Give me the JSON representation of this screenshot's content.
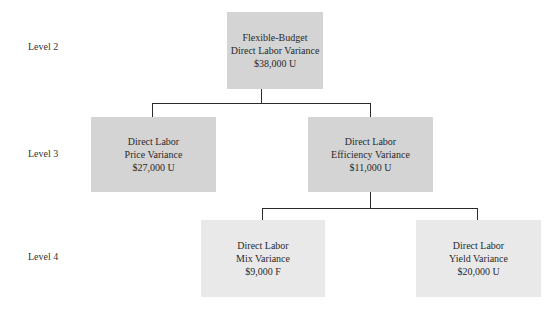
{
  "levels": [
    "Level 2",
    "Level 3",
    "Level 4"
  ],
  "nodes": {
    "root": {
      "line1": "Flexible-Budget",
      "line2": "Direct Labor Variance",
      "value": "$38,000 U"
    },
    "price": {
      "line1": "Direct Labor",
      "line2": "Price Variance",
      "value": "$27,000 U"
    },
    "efficiency": {
      "line1": "Direct Labor",
      "line2": "Efficiency Variance",
      "value": "$11,000 U"
    },
    "mix": {
      "line1": "Direct Labor",
      "line2": "Mix Variance",
      "value": "$9,000 F"
    },
    "yield": {
      "line1": "Direct Labor",
      "line2": "Yield Variance",
      "value": "$20,000 U"
    }
  },
  "colors": {
    "level2_3_box": "#d4d4d4",
    "level4_box": "#e9e9e9",
    "connector": "#2b2b2b"
  }
}
